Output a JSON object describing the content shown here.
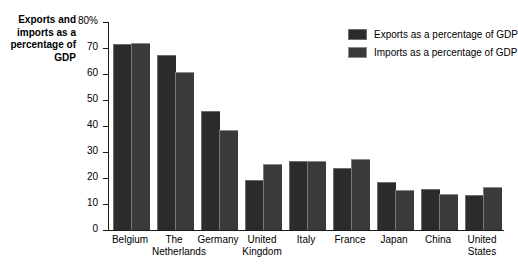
{
  "chart_data": {
    "type": "bar",
    "title": "",
    "xlabel": "",
    "ylabel": "Exports and imports as a percentage of GDP",
    "ylim": [
      0,
      80
    ],
    "ytick_labels": [
      "80%",
      "70",
      "60",
      "50",
      "40",
      "30",
      "20",
      "10",
      "0"
    ],
    "ytick_values": [
      80,
      70,
      60,
      50,
      40,
      30,
      20,
      10,
      0
    ],
    "grid": false,
    "legend_position": "top-right",
    "categories": [
      "Belgium",
      "The Netherlands",
      "Germany",
      "United Kingdom",
      "Italy",
      "France",
      "Japan",
      "China",
      "United States"
    ],
    "category_lines": [
      [
        "Belgium"
      ],
      [
        "The",
        "Netherlands"
      ],
      [
        "Germany"
      ],
      [
        "United",
        "Kingdom"
      ],
      [
        "Italy"
      ],
      [
        "France"
      ],
      [
        "Japan"
      ],
      [
        "China"
      ],
      [
        "United",
        "States"
      ]
    ],
    "series": [
      {
        "name": "Exports as a percentage of GDP",
        "color": "#2b2b2b",
        "values": [
          71,
          67,
          45.5,
          19,
          26,
          23.5,
          18,
          15.5,
          13
        ]
      },
      {
        "name": "Imports as a percentage of GDP",
        "color": "#3a3a3a",
        "values": [
          71.5,
          60.5,
          38,
          25,
          26,
          27,
          15,
          13.5,
          16
        ]
      }
    ]
  },
  "legend": {
    "items": [
      {
        "label": "Exports as a percentage of GDP"
      },
      {
        "label": "Imports as a percentage of GDP"
      }
    ]
  },
  "axis": {
    "y_title": "Exports and imports as a percentage of GDP"
  }
}
